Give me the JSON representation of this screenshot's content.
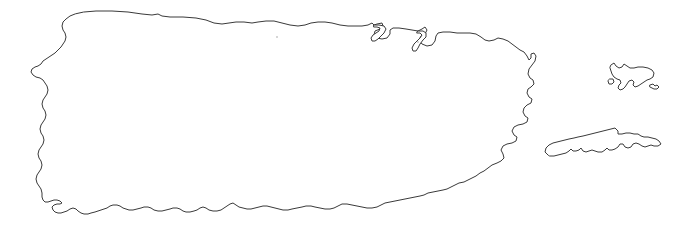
{
  "map": {
    "title": "Puerto Rico",
    "subject": "Commonwealth of Puerto Rico outline map",
    "projection_note": "plain coastline outline, no labels",
    "canvas": {
      "width": 681,
      "height": 227
    },
    "background_color": "#ffffff",
    "stroke_color": "#3a3a3a",
    "stroke_width": 1,
    "fill_color": "#ffffff",
    "labels_visible": false,
    "graticule_visible": false,
    "legend_visible": false,
    "scalebar_visible": false,
    "features": [
      {
        "name": "main-island",
        "label": "Puerto Rico (main island)",
        "bbox": [
          30,
          9,
          548,
          215
        ],
        "path": "M 84 12 L 96 11 L 112 11 L 128 12 L 142 14 L 152 15 L 158 14 L 162 16 L 170 17 L 183 17 L 196 18 L 206 20 L 214 23 L 222 24 L 229 23 L 236 22 L 244 22 L 252 23 L 258 22 L 266 21 L 274 21 L 282 23 L 290 25 L 298 26 L 305 25 L 311 23 L 318 22 L 325 22 L 332 23 L 340 25 L 348 26 L 356 26 L 362 26 L 368 25 L 372 23 L 374 25 L 377 24 L 382 23 L 383 26 L 380 29 L 375 31 L 374 35 L 377 38 L 382 39 L 387 38 L 390 34 L 390 30 L 393 28 L 399 28 L 406 29 L 412 30 L 418 31 L 422 29 L 425 27 L 427 30 L 425 34 L 421 36 L 419 40 L 422 44 L 427 46 L 432 45 L 435 41 L 436 36 L 438 33 L 443 32 L 450 32 L 457 33 L 464 33 L 470 33 L 476 34 L 481 37 L 485 40 L 489 41 L 494 40 L 498 38 L 503 39 L 508 41 L 512 44 L 516 47 L 520 50 L 524 52 L 527 56 L 529 60 L 531 58 L 531 54 L 534 53 L 536 56 L 535 61 L 532 65 L 529 69 L 528 74 L 530 78 L 533 80 L 534 84 L 531 87 L 528 89 L 527 93 L 529 97 L 532 99 L 531 103 L 527 105 L 524 108 L 523 112 L 525 116 L 528 118 L 527 122 L 523 124 L 518 125 L 514 127 L 512 131 L 514 135 L 517 137 L 516 141 L 512 143 L 507 144 L 503 146 L 501 150 L 503 154 L 504 158 L 501 161 L 497 163 L 492 165 L 488 168 L 484 171 L 480 173 L 476 176 L 472 178 L 468 180 L 464 182 L 459 183 L 455 185 L 451 187 L 447 189 L 443 190 L 438 191 L 433 192 L 428 193 L 424 195 L 420 196 L 415 197 L 410 198 L 405 199 L 400 200 L 395 201 L 390 202 L 385 203 L 381 205 L 377 207 L 372 208 L 367 208 L 362 207 L 357 206 L 352 205 L 347 204 L 342 204 L 338 206 L 334 208 L 330 209 L 325 209 L 320 208 L 315 207 L 311 206 L 306 206 L 302 207 L 297 208 L 292 209 L 288 210 L 283 210 L 279 209 L 275 208 L 271 207 L 267 206 L 263 206 L 259 207 L 255 208 L 251 209 L 247 209 L 243 208 L 239 207 L 236 205 L 233 203 L 230 204 L 227 206 L 224 208 L 221 210 L 217 211 L 213 211 L 209 210 L 206 208 L 203 207 L 200 208 L 197 210 L 194 211 L 190 212 L 186 212 L 183 211 L 180 209 L 177 208 L 173 208 L 170 209 L 166 210 L 162 211 L 158 211 L 154 210 L 151 208 L 148 207 L 144 207 L 141 208 L 137 209 L 133 210 L 129 210 L 126 209 L 123 208 L 120 206 L 117 205 L 113 205 L 110 206 L 107 208 L 104 209 L 101 210 L 98 211 L 95 212 L 91 213 L 88 214 L 84 214 L 81 213 L 78 211 L 76 209 L 73 208 L 70 209 L 67 211 L 64 212 L 61 213 L 58 213 L 55 212 L 53 210 L 52 207 L 54 205 L 57 204 L 60 204 L 62 203 L 60 201 L 57 200 L 54 200 L 51 201 L 48 202 L 45 202 L 43 200 L 42 197 L 42 193 L 41 189 L 39 186 L 37 183 L 36 179 L 37 175 L 39 172 L 41 169 L 42 165 L 41 161 L 39 158 L 38 154 L 39 150 L 41 147 L 43 144 L 44 140 L 43 136 L 41 133 L 40 129 L 41 125 L 43 122 L 45 119 L 46 115 L 45 111 L 43 108 L 42 104 L 43 100 L 45 97 L 47 94 L 48 90 L 47 86 L 45 83 L 43 80 L 40 78 L 36 77 L 33 75 L 31 72 L 32 69 L 35 67 L 38 66 L 41 64 L 43 61 L 46 59 L 49 57 L 52 55 L 55 53 L 58 50 L 61 47 L 63 44 L 65 41 L 66 37 L 65 33 L 63 30 L 62 26 L 63 22 L 66 19 L 70 16 L 75 14 Z"
      },
      {
        "name": "san-juan-bay-inlet",
        "label": "San Juan bay inlet detail",
        "bbox": [
          370,
          22,
          30,
          30
        ],
        "path": "M 374 25 L 379 25 L 384 26 L 386 29 L 384 33 L 381 36 L 378 39 L 375 41 L 372 41 L 371 38 L 373 35 L 376 33 L 379 31 L 380 28 L 377 27 L 374 27 Z"
      },
      {
        "name": "cabo-rojo-bay-inlet",
        "label": "eastern bay inlet detail",
        "bbox": [
          414,
          28,
          26,
          28
        ],
        "path": "M 418 31 L 423 31 L 426 33 L 426 37 L 423 40 L 420 44 L 418 48 L 416 51 L 413 51 L 412 48 L 414 44 L 417 41 L 420 38 L 422 35 L 420 33 L 417 33 Z"
      },
      {
        "name": "culebra-island",
        "label": "Culebra",
        "bbox": [
          605,
          60,
          55,
          35
        ],
        "path": "M 611 65 L 614 63 L 616 66 L 619 68 L 622 67 L 624 64 L 627 66 L 630 68 L 634 68 L 638 67 L 643 67 L 648 68 L 652 70 L 654 73 L 653 77 L 650 79 L 647 80 L 644 82 L 641 84 L 638 86 L 635 87 L 633 85 L 634 82 L 632 80 L 629 81 L 627 84 L 625 87 L 623 89 L 620 90 L 618 88 L 619 85 L 621 83 L 620 80 L 617 79 L 614 77 L 612 74 L 611 71 L 610 68 Z"
      },
      {
        "name": "culebra-islet-west",
        "label": "small islet west of Culebra",
        "bbox": [
          607,
          77,
          9,
          9
        ],
        "path": "M 610 79 L 613 79 L 614 82 L 612 84 L 609 84 L 608 81 Z"
      },
      {
        "name": "culebra-cay-east",
        "label": "small cay east of Culebra",
        "bbox": [
          648,
          82,
          14,
          10
        ],
        "path": "M 650 85 L 653 84 L 655 86 L 657 85 L 659 87 L 657 89 L 654 89 L 652 88 L 650 87 Z"
      },
      {
        "name": "vieques-island",
        "label": "Vieques",
        "bbox": [
          543,
          127,
          120,
          35
        ],
        "path": "M 548 155 L 545 152 L 546 148 L 549 145 L 553 143 L 557 142 L 561 141 L 565 140 L 569 139 L 574 138 L 578 137 L 583 136 L 587 135 L 591 134 L 595 133 L 599 132 L 603 131 L 607 130 L 611 129 L 615 128 L 618 131 L 618 134 L 622 134 L 626 133 L 630 133 L 634 134 L 638 134 L 641 136 L 644 137 L 648 137 L 652 138 L 656 139 L 659 141 L 661 144 L 658 146 L 654 146 L 651 145 L 648 146 L 645 147 L 642 146 L 639 144 L 636 143 L 633 144 L 631 147 L 628 148 L 625 147 L 623 144 L 620 144 L 618 147 L 615 149 L 612 150 L 609 150 L 607 148 L 605 150 L 602 152 L 598 152 L 595 151 L 592 150 L 589 151 L 586 152 L 583 151 L 581 148 L 579 150 L 576 151 L 573 151 L 571 149 L 569 151 L 566 153 L 562 154 L 558 155 L 554 156 L 550 156 Z"
      }
    ],
    "specks": [
      {
        "name": "speck-north-central",
        "x": 277,
        "y": 37,
        "r": 1
      },
      {
        "name": "speck-north-east",
        "x": 418,
        "y": 42,
        "r": 1
      }
    ]
  }
}
